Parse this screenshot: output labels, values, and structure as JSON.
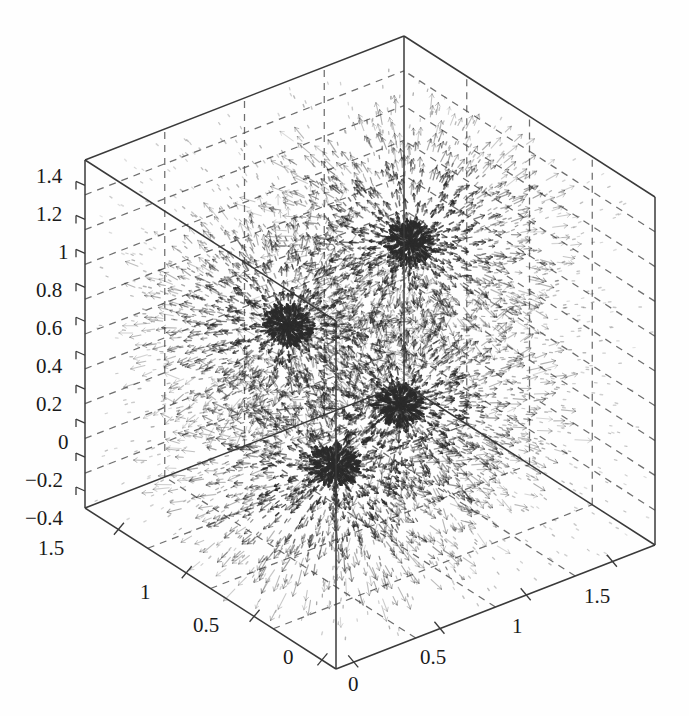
{
  "figure": {
    "kind": "3d-quiver-vector-field",
    "background_color": "#fefefe",
    "line_color": "#3a3a3a",
    "grid_color": "#555555",
    "arrow_color": "#2b2b2b",
    "title": "",
    "xlabel": "",
    "ylabel": "",
    "zlabel": ""
  },
  "chart_data": {
    "type": "scatter",
    "render": "3d-quiver",
    "title": "",
    "xlabel": "",
    "ylabel": "",
    "zlabel": "",
    "grid": true,
    "legend": null,
    "axes": {
      "x": {
        "label": "",
        "ticks": [
          0,
          0.5,
          1,
          1.5
        ],
        "tick_labels": [
          "0",
          "0.5",
          "1",
          "1.5"
        ],
        "lim": [
          -0.1,
          1.75
        ],
        "position": "bottom-right-edge"
      },
      "y": {
        "label": "",
        "ticks": [
          0,
          0.5,
          1,
          1.5
        ],
        "tick_labels": [
          "0",
          "0.5",
          "1",
          "1.5"
        ],
        "lim": [
          -0.1,
          1.75
        ],
        "position": "bottom-left-edge"
      },
      "z": {
        "label": "",
        "ticks": [
          -0.4,
          -0.2,
          0,
          0.2,
          0.4,
          0.6,
          0.8,
          1.0,
          1.2,
          1.4
        ],
        "tick_labels": [
          "−0.4",
          "−0.2",
          "0",
          "0.2",
          "0.4",
          "0.6",
          "0.8",
          "1",
          "1.2",
          "1.4"
        ],
        "lim": [
          -0.5,
          1.55
        ],
        "position": "left-vertical-edge"
      }
    },
    "sources": [
      {
        "name": "source-back-upper",
        "px": 410,
        "py": 243,
        "strength": 1.0,
        "radius": 150
      },
      {
        "name": "source-left-mid",
        "px": 288,
        "py": 325,
        "strength": 0.95,
        "radius": 145
      },
      {
        "name": "source-right-mid",
        "px": 400,
        "py": 405,
        "strength": 1.0,
        "radius": 155
      },
      {
        "name": "source-front-lower",
        "px": 335,
        "py": 467,
        "strength": 1.05,
        "radius": 165
      }
    ]
  },
  "axis_labels": {
    "z": [
      {
        "text": "1.4",
        "x": 36,
        "y": 164
      },
      {
        "text": "1.2",
        "x": 36,
        "y": 202
      },
      {
        "text": "1",
        "x": 58,
        "y": 240
      },
      {
        "text": "0.8",
        "x": 36,
        "y": 278
      },
      {
        "text": "0.6",
        "x": 36,
        "y": 316
      },
      {
        "text": "0.4",
        "x": 36,
        "y": 354
      },
      {
        "text": "0.2",
        "x": 36,
        "y": 392
      },
      {
        "text": "0",
        "x": 58,
        "y": 430
      },
      {
        "text": "−0.2",
        "x": 25,
        "y": 468
      },
      {
        "text": "−0.4",
        "x": 25,
        "y": 506
      }
    ],
    "y": [
      {
        "text": "1.5",
        "x": 38,
        "y": 536
      },
      {
        "text": "1",
        "x": 140,
        "y": 580
      },
      {
        "text": "0.5",
        "x": 193,
        "y": 613
      },
      {
        "text": "0",
        "x": 283,
        "y": 645
      }
    ],
    "x": [
      {
        "text": "0",
        "x": 348,
        "y": 672
      },
      {
        "text": "0.5",
        "x": 420,
        "y": 645
      },
      {
        "text": "1",
        "x": 512,
        "y": 614
      },
      {
        "text": "1.5",
        "x": 584,
        "y": 584
      }
    ]
  },
  "box": {
    "corners": {
      "bottom_left": {
        "x": 85,
        "y": 508
      },
      "bottom_front": {
        "x": 336,
        "y": 669
      },
      "bottom_right": {
        "x": 655,
        "y": 545
      },
      "bottom_back": {
        "x": 405,
        "y": 404
      },
      "top_left": {
        "x": 85,
        "y": 160
      },
      "top_front": {
        "x": 336,
        "y": 321
      },
      "top_right": {
        "x": 655,
        "y": 193
      },
      "top_back": {
        "x": 405,
        "y": 37
      }
    },
    "n_grid_x": 4,
    "n_grid_y": 4,
    "n_grid_z": 10
  }
}
